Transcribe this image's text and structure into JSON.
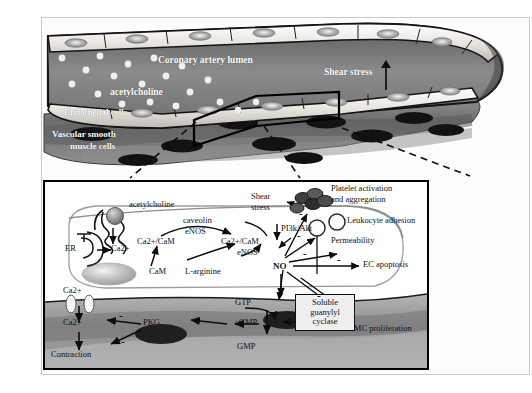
{
  "figure": {
    "type": "biomedical-pathway-diagram"
  },
  "vessel": {
    "labels": {
      "lumen": "Coronary artery lumen",
      "acetylcholine": "acetylcholine",
      "shear_stress": "Shear stress",
      "endothelial_cells": "Endothelial cells",
      "vsmc": "Vascular smooth\nmuscle cells",
      "vsmc_line1": "Vascular smooth",
      "vsmc_line2": "muscle cells"
    }
  },
  "panel": {
    "endothelial": {
      "acetylcholine": "acetylcholine",
      "caveolin": "caveolin",
      "enos_membrane": "eNOS",
      "er": "ER",
      "ca_er": "Ca2+",
      "cam": "CaM",
      "ca_cam_left": "Ca2+/CaM",
      "ca_cam_right": "Ca2+/CaM",
      "enos_active": "eNOS",
      "l_arginine": "L-arginine",
      "no": "NO",
      "shear_stress_l1": "Shear",
      "shear_stress_l2": "stress",
      "pi3k_akt": "PI3k/Akt"
    },
    "outcomes": {
      "platelet_l1": "Platelet activation",
      "platelet_l2": "and aggregation",
      "leukocyte": "Leukocyte adhesion",
      "permeability": "Permeability",
      "ec_apoptosis": "EC apoptosis",
      "vsmc_proliferation": "VSMC proliferation"
    },
    "smooth_muscle": {
      "ca_outside": "Ca2+",
      "ca_inside": "Ca2+",
      "contraction": "Contraction",
      "pkg": "PKG",
      "cgmp": "cGMP",
      "gtp": "GTP",
      "gmp": "GMP",
      "sgc_l1": "Soluble",
      "sgc_l2": "guanylyl",
      "sgc_l3": "cyclase"
    },
    "inhibition_marks": [
      "-",
      "-",
      "-",
      "-",
      "-",
      "-",
      "-"
    ]
  },
  "colors": {
    "lumen_dark": "#6f6f6f",
    "lumen_light": "#9a9a9a",
    "endothelium": "#e9e7e2",
    "vsmc_gray": "#7d7d7d",
    "vsmc_dark": "#4a4a4a",
    "nucleus": "#1b1b1b",
    "panel_border": "#000000",
    "frame": "#c8c8c8",
    "cell_body": "#ffffff",
    "sgc_box": "#efefef"
  }
}
